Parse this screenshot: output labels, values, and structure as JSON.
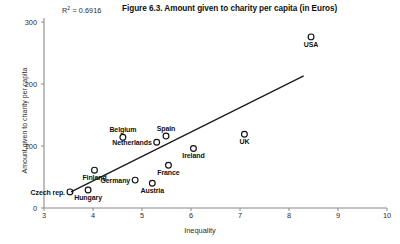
{
  "chart_data": {
    "type": "scatter",
    "title": "Figure 6.3. Amount given to charity per capita (in Euros)",
    "xlabel": "Inequality",
    "ylabel": "Amount given to charity per capita",
    "xlim": [
      3,
      10
    ],
    "ylim": [
      0,
      300
    ],
    "xticks": [
      "3",
      "4",
      "5",
      "6",
      "7",
      "8",
      "9",
      "10"
    ],
    "yticks": [
      "0",
      "100",
      "200",
      "300"
    ],
    "grid": false,
    "legend": null,
    "annotations": {
      "r_squared_prefix": "R",
      "r_squared_sup": "2",
      "r_squared_value": " = 0.6916",
      "r_squared_full": "R2 = 0.6916"
    },
    "trendline": {
      "visible": true,
      "x_start": 3.55,
      "y_start": 26,
      "x_end": 8.3,
      "y_end": 213
    },
    "points": [
      {
        "label": "Czech rep.",
        "x": 3.53,
        "y": 26,
        "label_pos": "left"
      },
      {
        "label": "Hungary",
        "x": 3.9,
        "y": 29,
        "label_pos": "below"
      },
      {
        "label": "Finland",
        "x": 4.03,
        "y": 61,
        "label_pos": "below"
      },
      {
        "label": "Germany",
        "x": 4.86,
        "y": 45,
        "label_pos": "left"
      },
      {
        "label": "Austria",
        "x": 5.21,
        "y": 40,
        "label_pos": "below"
      },
      {
        "label": "Belgium",
        "x": 4.61,
        "y": 114,
        "label_pos": "above"
      },
      {
        "label": "Netherlands",
        "x": 5.3,
        "y": 106,
        "label_pos": "left"
      },
      {
        "label": "Spain",
        "x": 5.49,
        "y": 116,
        "label_pos": "above"
      },
      {
        "label": "France",
        "x": 5.54,
        "y": 69,
        "label_pos": "below"
      },
      {
        "label": "Ireland",
        "x": 6.05,
        "y": 96,
        "label_pos": "below"
      },
      {
        "label": "UK",
        "x": 7.09,
        "y": 119,
        "label_pos": "below"
      },
      {
        "label": "USA",
        "x": 8.45,
        "y": 276,
        "label_pos": "below"
      }
    ]
  }
}
